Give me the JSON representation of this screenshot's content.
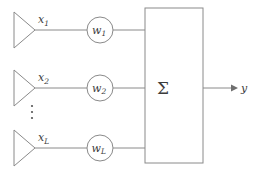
{
  "diagram": {
    "colors": {
      "stroke": "#8a8a8a",
      "text": "#3c3c3c",
      "background": "#ffffff",
      "arrow": "#6f6f6f"
    },
    "inputs": [
      {
        "id": "input-1",
        "signal_base": "x",
        "signal_sub": "1",
        "weight_base": "w",
        "weight_sub": "1",
        "row_y": 30
      },
      {
        "id": "input-2",
        "signal_base": "x",
        "signal_sub": "2",
        "weight_base": "w",
        "weight_sub": "2",
        "row_y": 88
      },
      {
        "id": "input-L",
        "signal_base": "x",
        "signal_sub": "L",
        "weight_base": "w",
        "weight_sub": "L",
        "row_y": 148
      }
    ],
    "ellipsis": {
      "label": "vertical-ellipsis",
      "dots": 3
    },
    "summer": {
      "symbol": "Σ",
      "name": "summation-block"
    },
    "output": {
      "base": "y",
      "sub": "",
      "arrow": "right-arrow"
    }
  }
}
